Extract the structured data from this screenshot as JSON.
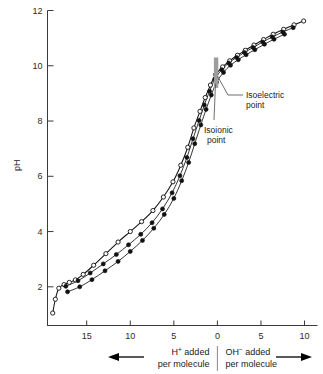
{
  "chart_data": {
    "type": "line",
    "title": "",
    "xlabel_left": "H+ added per molecule",
    "xlabel_right": "OH- added per molecule",
    "ylabel": "pH",
    "xlim": [
      19.5,
      -10.8
    ],
    "ylim": [
      0.6,
      12
    ],
    "grid": false,
    "legend_position": "none",
    "x_ticks": [
      15,
      10,
      5,
      0,
      5,
      10
    ],
    "x_tick_values": [
      15,
      10,
      5,
      0,
      -5,
      -10
    ],
    "y_ticks": [
      2,
      4,
      6,
      8,
      10,
      12
    ],
    "series": [
      {
        "name": "series-open-circles",
        "marker": "open-circle",
        "points": [
          [
            18.9,
            1.05
          ],
          [
            18.6,
            1.55
          ],
          [
            18.2,
            1.95
          ],
          [
            17.6,
            2.08
          ],
          [
            17.0,
            2.16
          ],
          [
            16.3,
            2.25
          ],
          [
            15.4,
            2.45
          ],
          [
            14.2,
            2.78
          ],
          [
            12.8,
            3.2
          ],
          [
            11.4,
            3.62
          ],
          [
            10.0,
            4.0
          ],
          [
            8.7,
            4.36
          ],
          [
            7.4,
            4.76
          ],
          [
            6.2,
            5.25
          ],
          [
            5.1,
            5.8
          ],
          [
            4.2,
            6.4
          ],
          [
            3.4,
            7.05
          ],
          [
            2.7,
            7.75
          ],
          [
            2.0,
            8.35
          ],
          [
            1.4,
            8.85
          ],
          [
            0.8,
            9.3
          ],
          [
            0.2,
            9.68
          ],
          [
            -0.6,
            9.96
          ],
          [
            -1.4,
            10.18
          ],
          [
            -2.3,
            10.38
          ],
          [
            -3.2,
            10.56
          ],
          [
            -4.2,
            10.75
          ],
          [
            -5.3,
            10.95
          ],
          [
            -6.4,
            11.14
          ],
          [
            -7.6,
            11.32
          ],
          [
            -8.8,
            11.48
          ],
          [
            -9.9,
            11.62
          ]
        ]
      },
      {
        "name": "series-filled-circles-a",
        "marker": "filled-circle",
        "points": [
          [
            17.4,
            2.02
          ],
          [
            16.0,
            2.22
          ],
          [
            14.6,
            2.5
          ],
          [
            13.1,
            2.83
          ],
          [
            11.6,
            3.17
          ],
          [
            10.2,
            3.52
          ],
          [
            8.8,
            3.9
          ],
          [
            7.5,
            4.32
          ],
          [
            6.3,
            4.82
          ],
          [
            5.2,
            5.4
          ],
          [
            4.3,
            6.02
          ],
          [
            3.5,
            6.68
          ],
          [
            2.8,
            7.36
          ],
          [
            2.1,
            8.02
          ],
          [
            1.5,
            8.58
          ],
          [
            0.9,
            9.08
          ],
          [
            0.3,
            9.52
          ],
          [
            -0.5,
            9.86
          ],
          [
            -1.3,
            10.1
          ],
          [
            -2.2,
            10.3
          ],
          [
            -3.1,
            10.48
          ],
          [
            -4.1,
            10.66
          ],
          [
            -5.2,
            10.86
          ],
          [
            -6.3,
            11.04
          ],
          [
            -7.5,
            11.22
          ],
          [
            -8.7,
            11.38
          ]
        ]
      },
      {
        "name": "series-filled-circles-b",
        "marker": "filled-circle",
        "points": [
          [
            17.2,
            1.82
          ],
          [
            15.8,
            2.0
          ],
          [
            14.4,
            2.26
          ],
          [
            12.9,
            2.58
          ],
          [
            11.4,
            2.92
          ],
          [
            10.0,
            3.28
          ],
          [
            8.6,
            3.68
          ],
          [
            7.3,
            4.12
          ],
          [
            6.1,
            4.62
          ],
          [
            5.0,
            5.2
          ],
          [
            4.1,
            5.84
          ],
          [
            3.3,
            6.5
          ],
          [
            2.6,
            7.18
          ],
          [
            1.9,
            7.86
          ],
          [
            1.3,
            8.42
          ],
          [
            0.7,
            8.94
          ],
          [
            0.1,
            9.4
          ],
          [
            -0.7,
            9.76
          ],
          [
            -1.5,
            10.02
          ],
          [
            -2.4,
            10.22
          ],
          [
            -3.3,
            10.4
          ],
          [
            -4.3,
            10.58
          ],
          [
            -5.4,
            10.78
          ],
          [
            -6.5,
            10.96
          ],
          [
            -7.7,
            11.14
          ]
        ]
      }
    ],
    "annotations": [
      {
        "name": "isoelectric-point",
        "label_line1": "Isoelectric",
        "label_line2": "point",
        "target_x": 0.15,
        "target_y": 9.55
      },
      {
        "name": "isoionic-point",
        "label_line1": "Isoionic",
        "label_line2": "point",
        "target_x": 0.15,
        "target_y": 9.9
      }
    ],
    "marker_bar": {
      "name": "isoionic-isoelectric-bar",
      "x": 0.15,
      "y_top": 10.3,
      "y_bottom": 9.2,
      "color": "#9d9d9d"
    }
  },
  "axis": {
    "y_label": "pH",
    "y_tick_labels": [
      "2",
      "4",
      "6",
      "8",
      "10",
      "12"
    ],
    "x_tick_labels": [
      "15",
      "10",
      "5",
      "0",
      "5",
      "10"
    ]
  },
  "footer": {
    "left_ion": "H",
    "left_sup": "+",
    "left_word": " added",
    "left_line2": "per molecule",
    "right_ion": "OH",
    "right_sup": "−",
    "right_word": " added",
    "right_line2": "per molecule",
    "left_arrow": "left-arrow",
    "right_arrow": "right-arrow"
  }
}
